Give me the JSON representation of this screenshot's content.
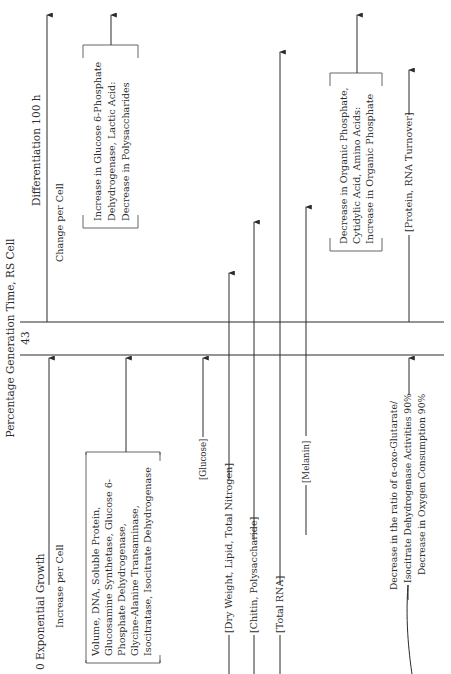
{
  "diagram": {
    "orientation": "rotated-90-ccw",
    "axis": {
      "title": "Percentage Generation Time, RS Cell",
      "start_label": "0 Exponential Growth",
      "marker_label": "43",
      "end_label": "Differentiation 100 h"
    },
    "phases": {
      "before": "Increase per Cell",
      "after": "Change per Cell"
    },
    "increase_group": {
      "lines": [
        "Volume, DNA, Soluble Protein,",
        "Glucosamine Synthetase, Glucose 6-",
        "Phosphate Dehydrogenase,",
        "Glycine-Alanine Transaminase,",
        "Isocitratase, Isocitrate Dehydrogenase"
      ]
    },
    "after_groups": {
      "glucose6": {
        "lines": [
          "Increase in Glucose 6-Phosphate",
          "Dehydrogenase, Lactic Acid:",
          "Decrease in Polysaccharides"
        ]
      },
      "phosphate": {
        "lines": [
          "Decrease in Organic Phosphate,",
          "Cytidylic Acid, Amino Acids:",
          "Increase in Organic Phosphate"
        ]
      }
    },
    "items": [
      {
        "label": "[Glucose]"
      },
      {
        "label": "[Dry Weight, Lipid, Total Nitrogen]"
      },
      {
        "label": "[Chitin, Polysaccharide]"
      },
      {
        "label": "[Total RNA]"
      },
      {
        "label": "[Melanin]"
      },
      {
        "label": "[Protein, RNA Turnover]"
      }
    ],
    "decrease_group": {
      "lines": [
        "Decrease in the ratio of α-oxo-Glutarate/",
        "Isocitrate Dehydrogenase Activities 90%",
        "Decrease in Oxygen Consumption 90%"
      ]
    }
  }
}
